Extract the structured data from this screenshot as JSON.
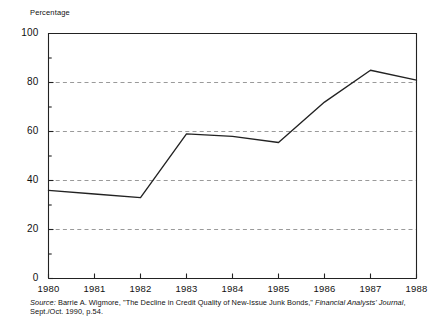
{
  "chart_data": {
    "type": "line",
    "title": "",
    "subtitle": "",
    "ylabel": "Percentage",
    "xlabel": "",
    "x": [
      1980,
      1981,
      1982,
      1983,
      1984,
      1985,
      1986,
      1987,
      1988
    ],
    "categories": [
      "1980",
      "1981",
      "1982",
      "1983",
      "1984",
      "1985",
      "1986",
      "1987",
      "1988"
    ],
    "values": [
      36,
      34.5,
      33,
      59,
      58,
      55.5,
      72,
      85,
      81
    ],
    "series": [
      {
        "name": "Percentage",
        "values": [
          36,
          34.5,
          33,
          59,
          58,
          55.5,
          72,
          85,
          81
        ]
      }
    ],
    "ylim": [
      0,
      100
    ],
    "xlim": [
      1980,
      1988
    ],
    "ytick_labels": [
      "0",
      "20",
      "40",
      "60",
      "80",
      "100"
    ],
    "ytick_values": [
      0,
      20,
      40,
      60,
      80,
      100
    ],
    "yminor_tick_values": [
      10,
      30,
      50,
      70,
      90
    ],
    "xtick_labels": [
      "1980",
      "1981",
      "1982",
      "1983",
      "1984",
      "1985",
      "1986",
      "1987",
      "1988"
    ],
    "grid": "horizontal-dashed-at-20-40-60-80",
    "legend": "none",
    "line_color": "#222222",
    "grid_color": "#9a9a9a",
    "axis_color": "#222222"
  },
  "source": {
    "label": "Source:",
    "text_before_journal": "Barrie A. Wigmore, \"The Decline in Credit Quality of New-Issue Junk Bonds,\"",
    "journal": "Financial Analysts' Journal",
    "text_after_journal": ", Sept./Oct. 1990, p.54."
  }
}
